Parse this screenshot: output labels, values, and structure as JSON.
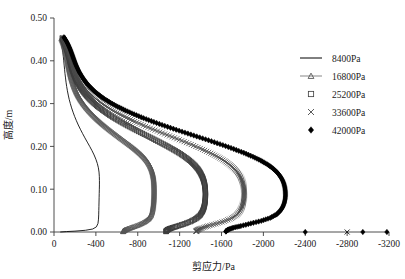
{
  "chart_data": {
    "type": "line",
    "title": "",
    "xlabel": "剪应力/Pa",
    "ylabel": "高度/m",
    "xlim": [
      0,
      -3200
    ],
    "ylim": [
      0.0,
      0.5
    ],
    "grid": false,
    "legend_position": "right",
    "x_ticks": [
      "0",
      "-400",
      "-800",
      "-1200",
      "-1600",
      "-2000",
      "-2400",
      "-2800",
      "-3200"
    ],
    "x_tick_values": [
      0,
      -400,
      -800,
      -1200,
      -1600,
      -2000,
      -2400,
      -2800,
      -3200
    ],
    "y_ticks": [
      "0.00",
      "0.10",
      "0.20",
      "0.30",
      "0.40",
      "0.50"
    ],
    "y_tick_values": [
      0.0,
      0.1,
      0.2,
      0.3,
      0.4,
      0.5
    ],
    "series": [
      {
        "name": "8400Pa",
        "marker": "line",
        "color": "#000000",
        "points": [
          [
            -60,
            0.45
          ],
          [
            -70,
            0.44
          ],
          [
            -78,
            0.43
          ],
          [
            -84,
            0.42
          ],
          [
            -89,
            0.41
          ],
          [
            -93,
            0.4
          ],
          [
            -97,
            0.39
          ],
          [
            -101,
            0.38
          ],
          [
            -105,
            0.37
          ],
          [
            -110,
            0.36
          ],
          [
            -115,
            0.35
          ],
          [
            -121,
            0.34
          ],
          [
            -128,
            0.33
          ],
          [
            -136,
            0.32
          ],
          [
            -145,
            0.31
          ],
          [
            -156,
            0.3
          ],
          [
            -168,
            0.29
          ],
          [
            -182,
            0.28
          ],
          [
            -197,
            0.27
          ],
          [
            -214,
            0.26
          ],
          [
            -232,
            0.25
          ],
          [
            -252,
            0.24
          ],
          [
            -273,
            0.23
          ],
          [
            -295,
            0.22
          ],
          [
            -318,
            0.21
          ],
          [
            -341,
            0.2
          ],
          [
            -363,
            0.19
          ],
          [
            -383,
            0.18
          ],
          [
            -400,
            0.17
          ],
          [
            -414,
            0.16
          ],
          [
            -424,
            0.15
          ],
          [
            -430,
            0.14
          ],
          [
            -433,
            0.13
          ],
          [
            -434,
            0.12
          ],
          [
            -434,
            0.11
          ],
          [
            -433,
            0.1
          ],
          [
            -432,
            0.09
          ],
          [
            -431,
            0.08
          ],
          [
            -430,
            0.07
          ],
          [
            -429,
            0.06
          ],
          [
            -428,
            0.05
          ],
          [
            -427,
            0.04
          ],
          [
            -425,
            0.03
          ],
          [
            -420,
            0.02
          ],
          [
            -405,
            0.012
          ],
          [
            -370,
            0.007
          ],
          [
            -300,
            0.004
          ],
          [
            -200,
            0.002
          ],
          [
            -120,
            0.001
          ],
          [
            -60,
            0.0
          ]
        ]
      },
      {
        "name": "16800Pa",
        "marker": "triangle",
        "color": "#555555",
        "points": [
          [
            -70,
            0.452
          ],
          [
            -85,
            0.443
          ],
          [
            -97,
            0.434
          ],
          [
            -107,
            0.425
          ],
          [
            -115,
            0.416
          ],
          [
            -122,
            0.407
          ],
          [
            -129,
            0.398
          ],
          [
            -136,
            0.389
          ],
          [
            -144,
            0.38
          ],
          [
            -152,
            0.371
          ],
          [
            -161,
            0.362
          ],
          [
            -172,
            0.353
          ],
          [
            -184,
            0.344
          ],
          [
            -198,
            0.335
          ],
          [
            -214,
            0.326
          ],
          [
            -233,
            0.317
          ],
          [
            -255,
            0.308
          ],
          [
            -280,
            0.299
          ],
          [
            -308,
            0.29
          ],
          [
            -340,
            0.281
          ],
          [
            -375,
            0.272
          ],
          [
            -413,
            0.263
          ],
          [
            -454,
            0.254
          ],
          [
            -498,
            0.245
          ],
          [
            -544,
            0.236
          ],
          [
            -592,
            0.227
          ],
          [
            -641,
            0.218
          ],
          [
            -691,
            0.209
          ],
          [
            -740,
            0.2
          ],
          [
            -786,
            0.191
          ],
          [
            -828,
            0.182
          ],
          [
            -864,
            0.173
          ],
          [
            -893,
            0.164
          ],
          [
            -915,
            0.155
          ],
          [
            -931,
            0.146
          ],
          [
            -942,
            0.137
          ],
          [
            -949,
            0.128
          ],
          [
            -953,
            0.119
          ],
          [
            -955,
            0.11
          ],
          [
            -956,
            0.101
          ],
          [
            -956,
            0.092
          ],
          [
            -955,
            0.083
          ],
          [
            -953,
            0.074
          ],
          [
            -950,
            0.065
          ],
          [
            -945,
            0.056
          ],
          [
            -938,
            0.047
          ],
          [
            -925,
            0.038
          ],
          [
            -900,
            0.03
          ],
          [
            -860,
            0.023
          ],
          [
            -810,
            0.017
          ],
          [
            -755,
            0.012
          ],
          [
            -710,
            0.008
          ],
          [
            -680,
            0.005
          ],
          [
            -665,
            0.003
          ],
          [
            -660,
            0.001
          ]
        ]
      },
      {
        "name": "25200Pa",
        "marker": "square",
        "color": "#3d3d3d",
        "points": [
          [
            -78,
            0.453
          ],
          [
            -95,
            0.444
          ],
          [
            -110,
            0.435
          ],
          [
            -122,
            0.426
          ],
          [
            -133,
            0.417
          ],
          [
            -143,
            0.408
          ],
          [
            -152,
            0.399
          ],
          [
            -162,
            0.39
          ],
          [
            -173,
            0.381
          ],
          [
            -185,
            0.372
          ],
          [
            -199,
            0.363
          ],
          [
            -215,
            0.354
          ],
          [
            -234,
            0.345
          ],
          [
            -256,
            0.336
          ],
          [
            -282,
            0.327
          ],
          [
            -312,
            0.318
          ],
          [
            -346,
            0.309
          ],
          [
            -385,
            0.3
          ],
          [
            -429,
            0.291
          ],
          [
            -478,
            0.282
          ],
          [
            -532,
            0.273
          ],
          [
            -591,
            0.264
          ],
          [
            -654,
            0.255
          ],
          [
            -721,
            0.246
          ],
          [
            -791,
            0.237
          ],
          [
            -863,
            0.228
          ],
          [
            -936,
            0.219
          ],
          [
            -1008,
            0.21
          ],
          [
            -1078,
            0.201
          ],
          [
            -1144,
            0.192
          ],
          [
            -1205,
            0.183
          ],
          [
            -1259,
            0.174
          ],
          [
            -1305,
            0.165
          ],
          [
            -1344,
            0.156
          ],
          [
            -1375,
            0.147
          ],
          [
            -1399,
            0.138
          ],
          [
            -1417,
            0.129
          ],
          [
            -1430,
            0.12
          ],
          [
            -1439,
            0.111
          ],
          [
            -1444,
            0.102
          ],
          [
            -1447,
            0.093
          ],
          [
            -1447,
            0.084
          ],
          [
            -1445,
            0.075
          ],
          [
            -1440,
            0.066
          ],
          [
            -1432,
            0.057
          ],
          [
            -1418,
            0.048
          ],
          [
            -1395,
            0.039
          ],
          [
            -1355,
            0.031
          ],
          [
            -1300,
            0.024
          ],
          [
            -1235,
            0.018
          ],
          [
            -1170,
            0.013
          ],
          [
            -1120,
            0.009
          ],
          [
            -1090,
            0.006
          ],
          [
            -1075,
            0.003
          ],
          [
            -1070,
            0.001
          ]
        ]
      },
      {
        "name": "33600Pa",
        "marker": "cross",
        "color": "#4a4a4a",
        "points": [
          [
            -85,
            0.454
          ],
          [
            -104,
            0.445
          ],
          [
            -120,
            0.436
          ],
          [
            -134,
            0.427
          ],
          [
            -146,
            0.418
          ],
          [
            -157,
            0.409
          ],
          [
            -168,
            0.4
          ],
          [
            -180,
            0.391
          ],
          [
            -193,
            0.382
          ],
          [
            -208,
            0.373
          ],
          [
            -225,
            0.364
          ],
          [
            -245,
            0.355
          ],
          [
            -268,
            0.346
          ],
          [
            -295,
            0.337
          ],
          [
            -326,
            0.328
          ],
          [
            -363,
            0.319
          ],
          [
            -405,
            0.31
          ],
          [
            -453,
            0.301
          ],
          [
            -508,
            0.292
          ],
          [
            -569,
            0.283
          ],
          [
            -637,
            0.274
          ],
          [
            -711,
            0.265
          ],
          [
            -791,
            0.256
          ],
          [
            -876,
            0.247
          ],
          [
            -965,
            0.238
          ],
          [
            -1057,
            0.229
          ],
          [
            -1150,
            0.22
          ],
          [
            -1243,
            0.211
          ],
          [
            -1333,
            0.202
          ],
          [
            -1419,
            0.193
          ],
          [
            -1498,
            0.184
          ],
          [
            -1569,
            0.175
          ],
          [
            -1630,
            0.166
          ],
          [
            -1681,
            0.157
          ],
          [
            -1722,
            0.148
          ],
          [
            -1754,
            0.139
          ],
          [
            -1778,
            0.13
          ],
          [
            -1795,
            0.121
          ],
          [
            -1807,
            0.112
          ],
          [
            -1814,
            0.103
          ],
          [
            -1817,
            0.094
          ],
          [
            -1817,
            0.085
          ],
          [
            -1814,
            0.076
          ],
          [
            -1807,
            0.067
          ],
          [
            -1795,
            0.058
          ],
          [
            -1776,
            0.049
          ],
          [
            -1745,
            0.04
          ],
          [
            -1695,
            0.032
          ],
          [
            -1625,
            0.025
          ],
          [
            -1545,
            0.019
          ],
          [
            -1470,
            0.014
          ],
          [
            -1412,
            0.009
          ],
          [
            -1378,
            0.006
          ],
          [
            -1362,
            0.003
          ],
          [
            -1357,
            0.001
          ]
        ]
      },
      {
        "name": "42000Pa",
        "marker": "diamond",
        "color": "#000000",
        "points": [
          [
            -95,
            0.455
          ],
          [
            -118,
            0.446
          ],
          [
            -137,
            0.437
          ],
          [
            -153,
            0.428
          ],
          [
            -167,
            0.419
          ],
          [
            -180,
            0.41
          ],
          [
            -193,
            0.401
          ],
          [
            -207,
            0.392
          ],
          [
            -223,
            0.383
          ],
          [
            -241,
            0.374
          ],
          [
            -262,
            0.365
          ],
          [
            -286,
            0.356
          ],
          [
            -314,
            0.347
          ],
          [
            -347,
            0.338
          ],
          [
            -385,
            0.329
          ],
          [
            -430,
            0.32
          ],
          [
            -481,
            0.311
          ],
          [
            -540,
            0.302
          ],
          [
            -607,
            0.293
          ],
          [
            -682,
            0.284
          ],
          [
            -765,
            0.275
          ],
          [
            -856,
            0.266
          ],
          [
            -954,
            0.257
          ],
          [
            -1058,
            0.248
          ],
          [
            -1167,
            0.239
          ],
          [
            -1279,
            0.23
          ],
          [
            -1392,
            0.221
          ],
          [
            -1504,
            0.212
          ],
          [
            -1613,
            0.203
          ],
          [
            -1717,
            0.194
          ],
          [
            -1813,
            0.185
          ],
          [
            -1900,
            0.176
          ],
          [
            -1975,
            0.167
          ],
          [
            -2038,
            0.158
          ],
          [
            -2089,
            0.149
          ],
          [
            -2129,
            0.14
          ],
          [
            -2159,
            0.131
          ],
          [
            -2181,
            0.122
          ],
          [
            -2196,
            0.113
          ],
          [
            -2205,
            0.104
          ],
          [
            -2210,
            0.095
          ],
          [
            -2211,
            0.086
          ],
          [
            -2208,
            0.077
          ],
          [
            -2200,
            0.068
          ],
          [
            -2186,
            0.059
          ],
          [
            -2163,
            0.05
          ],
          [
            -2126,
            0.041
          ],
          [
            -2065,
            0.033
          ],
          [
            -1980,
            0.026
          ],
          [
            -1880,
            0.02
          ],
          [
            -1785,
            0.014
          ],
          [
            -1712,
            0.01
          ],
          [
            -1668,
            0.006
          ],
          [
            -1648,
            0.003
          ],
          [
            -1642,
            0.001
          ]
        ]
      }
    ],
    "axis_outliers": [
      {
        "series": "42000Pa",
        "marker": "diamond",
        "x": -2400,
        "y": 0.0
      },
      {
        "series": "33600Pa",
        "marker": "cross",
        "x": -2800,
        "y": 0.0
      },
      {
        "series": "42000Pa",
        "marker": "diamond",
        "x": -2950,
        "y": 0.0
      },
      {
        "series": "42000Pa",
        "marker": "diamond",
        "x": -3180,
        "y": 0.0
      }
    ]
  },
  "legend": {
    "items": [
      {
        "label": "8400Pa",
        "marker": "line"
      },
      {
        "label": "16800Pa",
        "marker": "triangle"
      },
      {
        "label": "25200Pa",
        "marker": "square"
      },
      {
        "label": "33600Pa",
        "marker": "cross"
      },
      {
        "label": "42000Pa",
        "marker": "diamond"
      }
    ]
  }
}
